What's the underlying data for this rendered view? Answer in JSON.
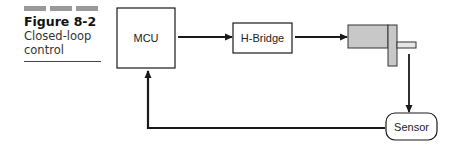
{
  "caption": {
    "figure_number": "Figure 8-2",
    "title_line1": "Closed-loop",
    "title_line2": "control"
  },
  "diagram": {
    "nodes": [
      {
        "id": "mcu",
        "label": "MCU",
        "shape": "rectangle"
      },
      {
        "id": "hbridge",
        "label": "H-Bridge",
        "shape": "rectangle"
      },
      {
        "id": "motor",
        "label": "",
        "shape": "motor-icon"
      },
      {
        "id": "sensor",
        "label": "Sensor",
        "shape": "rounded-rectangle"
      }
    ],
    "edges": [
      {
        "from": "mcu",
        "to": "hbridge"
      },
      {
        "from": "hbridge",
        "to": "motor"
      },
      {
        "from": "motor",
        "to": "sensor"
      },
      {
        "from": "sensor",
        "to": "mcu"
      }
    ],
    "colors": {
      "line": "#1a1a1a",
      "motor_fill": "#c8c8c8",
      "caption_bars": "#9a9a9a"
    }
  }
}
